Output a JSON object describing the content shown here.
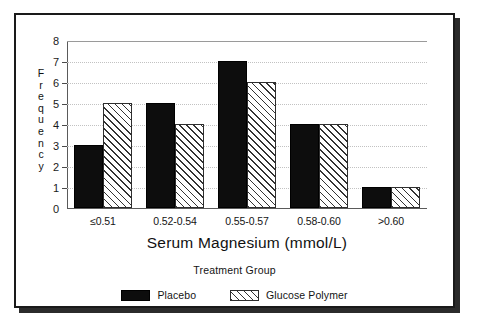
{
  "chart_data": {
    "type": "bar",
    "title": "",
    "xlabel": "Serum Magnesium (mmol/L)",
    "ylabel": "Frequency",
    "categories": [
      "≤0.51",
      "0.52-0.54",
      "0.55-0.57",
      "0.58-0.60",
      ">0.60"
    ],
    "series": [
      {
        "name": "Placebo",
        "values": [
          3,
          5,
          7,
          4,
          1
        ],
        "fill": "solid-black",
        "color": "#0d0d0d"
      },
      {
        "name": "Glucose Polymer",
        "values": [
          5,
          4,
          6,
          4,
          1
        ],
        "fill": "diagonal-hatch",
        "color": "#333333"
      }
    ],
    "ylim": [
      0,
      8
    ],
    "yticks": [
      0,
      1,
      2,
      3,
      4,
      5,
      6,
      7,
      8
    ],
    "grid": true,
    "grid_style": "dotted",
    "legend_position": "bottom",
    "legend_title": "Treatment Group"
  },
  "axes": {
    "y_title_letters": [
      "F",
      "r",
      "e",
      "q",
      "u",
      "e",
      "n",
      "c",
      "y"
    ],
    "x_title": "Serum Magnesium (mmol/L)"
  },
  "legend": {
    "title": "Treatment Group",
    "items": [
      {
        "label": "Placebo",
        "swatch": "solid-black"
      },
      {
        "label": "Glucose Polymer",
        "swatch": "diagonal-hatch"
      }
    ]
  }
}
